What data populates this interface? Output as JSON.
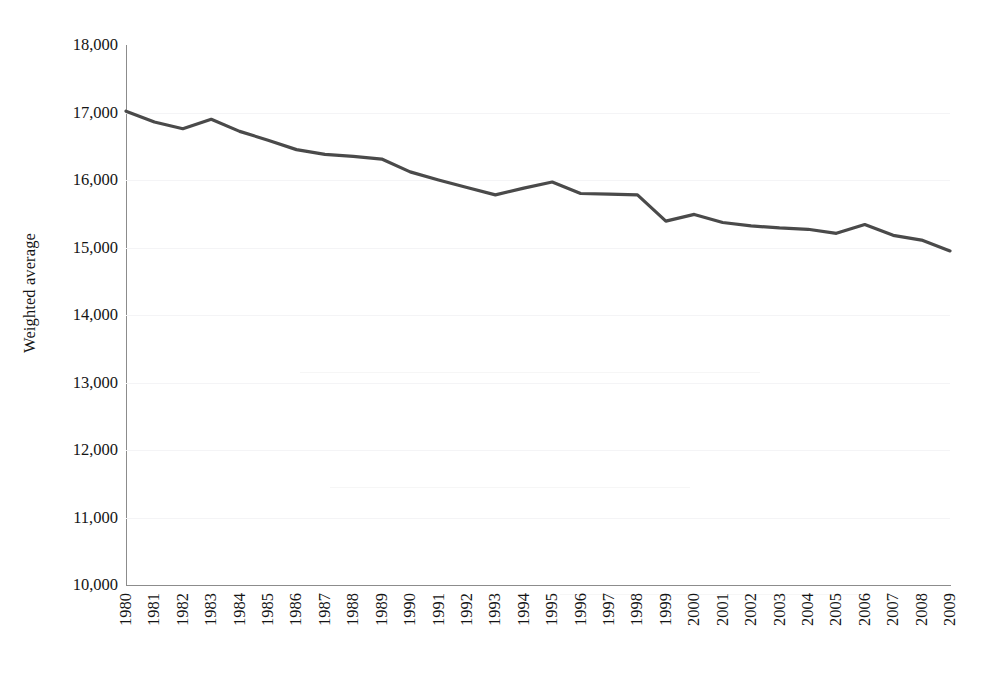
{
  "chart_data": {
    "type": "line",
    "title": "",
    "subtitle": "",
    "xlabel": "",
    "ylabel": "Weighted average",
    "categories": [
      "1980",
      "1981",
      "1982",
      "1983",
      "1984",
      "1985",
      "1986",
      "1987",
      "1988",
      "1989",
      "1990",
      "1991",
      "1992",
      "1993",
      "1994",
      "1995",
      "1996",
      "1997",
      "1998",
      "1999",
      "2000",
      "2001",
      "2002",
      "2003",
      "2004",
      "2005",
      "2006",
      "2007",
      "2008",
      "2009"
    ],
    "series": [
      {
        "name": "Weighted average",
        "color": "#4a4a4a",
        "values": [
          17020,
          16860,
          16760,
          16900,
          16720,
          16590,
          16450,
          16380,
          16350,
          16310,
          16120,
          16000,
          15890,
          15780,
          15880,
          15970,
          15800,
          15790,
          15780,
          15390,
          15490,
          15370,
          15320,
          15290,
          15270,
          15210,
          15340,
          15180,
          15110,
          14950
        ]
      }
    ],
    "ylim": [
      10000,
      18000
    ],
    "ytick_values": [
      18000,
      17000,
      16000,
      15000,
      14000,
      13000,
      12000,
      11000,
      10000
    ],
    "ytick_labels": [
      "18,000",
      "17,000",
      "16,000",
      "15,000",
      "14,000",
      "13,000",
      "12,000",
      "11,000",
      "10,000"
    ],
    "xtick_labels": [
      "1980",
      "1981",
      "1982",
      "1983",
      "1984",
      "1985",
      "1986",
      "1987",
      "1988",
      "1989",
      "1990",
      "1991",
      "1992",
      "1993",
      "1994",
      "1995",
      "1996",
      "1997",
      "1998",
      "1999",
      "2000",
      "2001",
      "2002",
      "2003",
      "2004",
      "2005",
      "2006",
      "2007",
      "2008",
      "2009"
    ],
    "grid": true,
    "grid_color": "#f4f4f6",
    "legend": false,
    "legend_position": "none",
    "axis_color": "#8c8c8c",
    "background_color": "#ffffff",
    "xtick_rotation": -90,
    "line_width": 3.2
  }
}
